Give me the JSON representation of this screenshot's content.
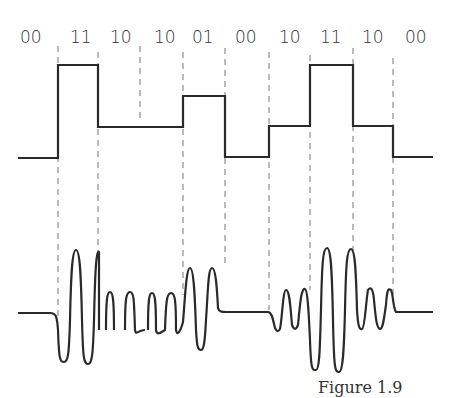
{
  "figure": {
    "bit_pairs": [
      "00",
      "11",
      "10",
      "10",
      "01",
      "00",
      "10",
      "11",
      "10",
      "00"
    ],
    "caption": "Figure 1.9",
    "levels": {
      "00": 0,
      "01": 1,
      "10": 2,
      "11": 3
    },
    "line_color": "#2a2a2a",
    "dashed_color": "#777777"
  }
}
